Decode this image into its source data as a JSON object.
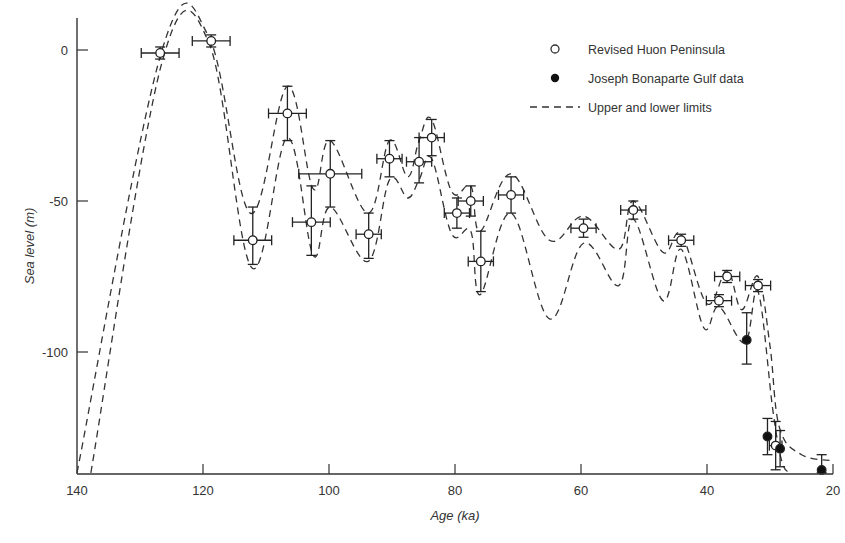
{
  "chart_data": {
    "type": "scatter",
    "title": "",
    "xlabel": "Age (ka)",
    "ylabel": "Sea level (m)",
    "xlim": [
      140,
      20
    ],
    "ylim": [
      -140,
      10
    ],
    "x_reversed": true,
    "grid": false,
    "legend_position": "upper right",
    "x_ticks": [
      140,
      120,
      100,
      80,
      60,
      40,
      20
    ],
    "y_ticks": [
      0,
      -50,
      -100
    ],
    "x_tick_labels": [
      "140",
      "120",
      "100",
      "80",
      "60",
      "40",
      "20"
    ],
    "y_tick_labels": [
      "0",
      "-50",
      "-100"
    ],
    "legend": [
      {
        "marker": "open-circle",
        "label": "Revised Huon Peninsula"
      },
      {
        "marker": "filled-circle",
        "label": "Joseph Bonaparte Gulf data"
      },
      {
        "marker": "dashed-line",
        "label": "Upper and lower limits"
      }
    ],
    "series": [
      {
        "name": "Revised Huon Peninsula",
        "marker": "open-circle",
        "points": [
          {
            "age": 126.8,
            "level": -1,
            "age_err": 3,
            "level_err_up": 2,
            "level_err_down": 2
          },
          {
            "age": 118.7,
            "level": 3,
            "age_err": 3,
            "level_err_up": 2,
            "level_err_down": 2
          },
          {
            "age": 112.1,
            "level": -63,
            "age_err": 3,
            "level_err_up": 11,
            "level_err_down": 8
          },
          {
            "age": 106.6,
            "level": -21,
            "age_err": 3,
            "level_err_up": 9,
            "level_err_down": 9
          },
          {
            "age": 102.8,
            "level": -57,
            "age_err": 3,
            "level_err_up": 12,
            "level_err_down": 11
          },
          {
            "age": 99.8,
            "level": -41,
            "age_err": 5,
            "level_err_up": 11,
            "level_err_down": 11
          },
          {
            "age": 93.7,
            "level": -61,
            "age_err": 2,
            "level_err_up": 7,
            "level_err_down": 8
          },
          {
            "age": 90.4,
            "level": -36,
            "age_err": 2,
            "level_err_up": 6,
            "level_err_down": 6
          },
          {
            "age": 85.7,
            "level": -37,
            "age_err": 2,
            "level_err_up": 8,
            "level_err_down": 7
          },
          {
            "age": 83.7,
            "level": -29,
            "age_err": 2,
            "level_err_up": 6,
            "level_err_down": 6
          },
          {
            "age": 79.7,
            "level": -54,
            "age_err": 2,
            "level_err_up": 5,
            "level_err_down": 5
          },
          {
            "age": 77.5,
            "level": -50,
            "age_err": 2,
            "level_err_up": 5,
            "level_err_down": 5
          },
          {
            "age": 75.9,
            "level": -70,
            "age_err": 2,
            "level_err_up": 10,
            "level_err_down": 10
          },
          {
            "age": 71.1,
            "level": -48,
            "age_err": 2,
            "level_err_up": 6,
            "level_err_down": 6
          },
          {
            "age": 59.6,
            "level": -59,
            "age_err": 2,
            "level_err_up": 3,
            "level_err_down": 3
          },
          {
            "age": 51.7,
            "level": -53,
            "age_err": 2,
            "level_err_up": 3,
            "level_err_down": 3
          },
          {
            "age": 44.1,
            "level": -63,
            "age_err": 2,
            "level_err_up": 2,
            "level_err_down": 2
          },
          {
            "age": 38.1,
            "level": -83,
            "age_err": 2,
            "level_err_up": 2,
            "level_err_down": 2
          },
          {
            "age": 36.8,
            "level": -75,
            "age_err": 2,
            "level_err_up": 2,
            "level_err_down": 2
          },
          {
            "age": 31.9,
            "level": -78,
            "age_err": 2,
            "level_err_up": 2,
            "level_err_down": 2
          },
          {
            "age": 29.1,
            "level": -131,
            "age_err": 1,
            "level_err_up": 8,
            "level_err_down": 8
          }
        ]
      },
      {
        "name": "Joseph Bonaparte Gulf data",
        "marker": "filled-circle",
        "points": [
          {
            "age": 33.7,
            "level": -96,
            "level_err_up": 9,
            "level_err_down": 8
          },
          {
            "age": 30.4,
            "level": -128,
            "level_err_up": 6,
            "level_err_down": 6
          },
          {
            "age": 28.4,
            "level": -132,
            "level_err_up": 6,
            "level_err_down": 6
          },
          {
            "age": 21.8,
            "level": -140,
            "level_err_up": 6,
            "level_err_down": 0
          }
        ]
      },
      {
        "name": "Upper limit",
        "style": "dashed",
        "points": [
          [
            140,
            -140
          ],
          [
            126.5,
            0
          ],
          [
            119,
            4
          ],
          [
            112.5,
            -54
          ],
          [
            106.6,
            -12
          ],
          [
            102.5,
            -46
          ],
          [
            99.8,
            -30
          ],
          [
            93.8,
            -54
          ],
          [
            90.4,
            -30
          ],
          [
            87.5,
            -42
          ],
          [
            85.7,
            -30
          ],
          [
            83.7,
            -23
          ],
          [
            80.5,
            -47
          ],
          [
            77.5,
            -45
          ],
          [
            76,
            -60
          ],
          [
            71.1,
            -41
          ],
          [
            65,
            -63
          ],
          [
            59.6,
            -55
          ],
          [
            54,
            -66
          ],
          [
            51.7,
            -50
          ],
          [
            47,
            -67
          ],
          [
            44.1,
            -61
          ],
          [
            40,
            -84
          ],
          [
            36.8,
            -73
          ],
          [
            34.5,
            -86
          ],
          [
            31.9,
            -75
          ],
          [
            30,
            -98
          ],
          [
            28.5,
            -125
          ],
          [
            25,
            -134
          ],
          [
            20,
            -136
          ]
        ]
      },
      {
        "name": "Lower limit",
        "style": "dashed",
        "points": [
          [
            137.8,
            -140
          ],
          [
            126.5,
            -4
          ],
          [
            119,
            2
          ],
          [
            112.3,
            -72
          ],
          [
            106.6,
            -29
          ],
          [
            102.5,
            -68
          ],
          [
            99.8,
            -52
          ],
          [
            93.8,
            -70
          ],
          [
            90.4,
            -43
          ],
          [
            87.5,
            -49
          ],
          [
            85.7,
            -43
          ],
          [
            83.7,
            -36
          ],
          [
            80.5,
            -61
          ],
          [
            77.5,
            -60
          ],
          [
            76,
            -81
          ],
          [
            71.1,
            -54
          ],
          [
            65,
            -89
          ],
          [
            59.6,
            -64
          ],
          [
            54,
            -78
          ],
          [
            51.7,
            -56
          ],
          [
            47,
            -83
          ],
          [
            44.1,
            -66
          ],
          [
            40.5,
            -92
          ],
          [
            38.1,
            -85
          ],
          [
            34,
            -97
          ],
          [
            31.9,
            -80
          ],
          [
            29.5,
            -120
          ],
          [
            28,
            -137
          ],
          [
            26.5,
            -140
          ]
        ]
      }
    ]
  }
}
